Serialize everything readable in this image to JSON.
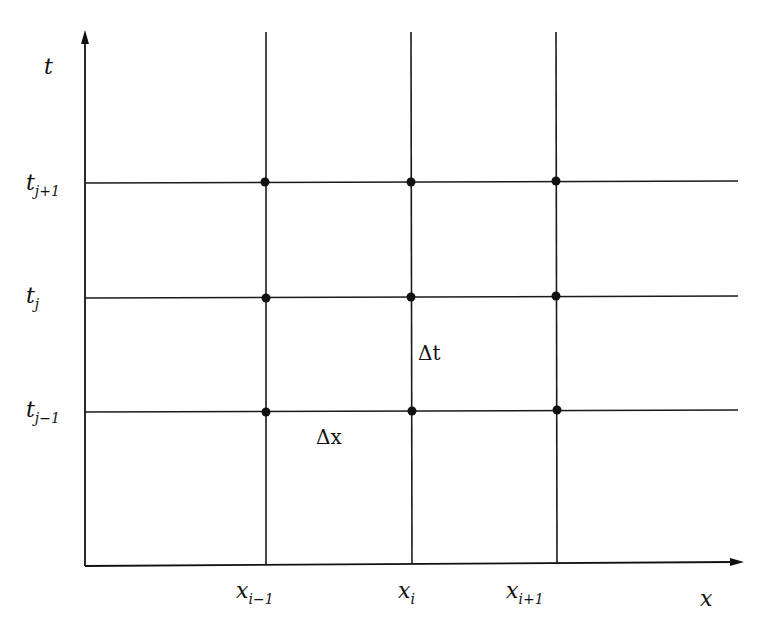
{
  "diagram": {
    "axes": {
      "x_label": "x",
      "t_label": "t"
    },
    "x_nodes": [
      {
        "base": "x",
        "sub": "i−1"
      },
      {
        "base": "x",
        "sub": "i"
      },
      {
        "base": "x",
        "sub": "i+1"
      }
    ],
    "t_nodes": [
      {
        "base": "t",
        "sub": "j+1"
      },
      {
        "base": "t",
        "sub": "j"
      },
      {
        "base": "t",
        "sub": "j−1"
      }
    ],
    "step_labels": {
      "dt": "Δt",
      "dx": "Δx"
    },
    "grid": {
      "columns": 3,
      "rows": 3,
      "nodes_marked": true
    },
    "colors": {
      "ink": "#111111",
      "background": "#ffffff"
    }
  }
}
